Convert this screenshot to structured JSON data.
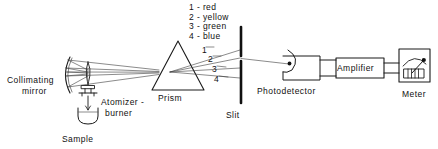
{
  "figure": {
    "background_color": "#ffffff",
    "line_color": "#1a1a1a",
    "ray_color": "#3a3a3a"
  },
  "legend": {
    "name": "dispersed-ray-color-key",
    "entries": [
      {
        "number": "1",
        "dash": "-",
        "color_name": "red",
        "text": "1 - red"
      },
      {
        "number": "2",
        "dash": "-",
        "color_name": "yellow",
        "text": "2 - yellow"
      },
      {
        "number": "3",
        "dash": "-",
        "color_name": "green",
        "text": "3 - green"
      },
      {
        "number": "4",
        "dash": "-",
        "color_name": "blue",
        "text": "4 - blue"
      }
    ],
    "block_text": "1 - red\n2 - yellow\n3 - green\n4 - blue"
  },
  "ray_numbers": {
    "one": "1",
    "two": "2",
    "three": "3",
    "four": "4"
  },
  "components": {
    "collimating_mirror": {
      "label_line1": "Collimating",
      "label_line2": "mirror",
      "icon": "concave-mirror-arc"
    },
    "sample": {
      "label": "Sample",
      "icon": "beaker-cup"
    },
    "atomizer_burner": {
      "label_line1": "Atomizer -",
      "label_line2": "burner",
      "icon": "flame-burner"
    },
    "prism": {
      "label": "Prism",
      "icon": "triangle-prism"
    },
    "slit": {
      "label": "Slit",
      "icon": "vertical-slit-bars"
    },
    "photodetector": {
      "label": "Photodetector",
      "icon": "phototube-arc"
    },
    "amplifier": {
      "label": "Amplifier",
      "icon": "rectangle-box"
    },
    "meter": {
      "label": "Meter",
      "icon": "analog-gauge-needle"
    }
  }
}
